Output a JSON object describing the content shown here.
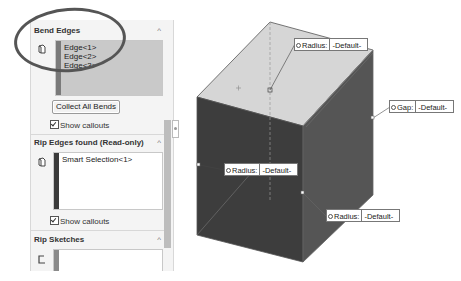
{
  "property_manager": {
    "bend_edges": {
      "title": "Bend Edges",
      "items": [
        "Edge<1>",
        "Edge<2>",
        "Edge<3>"
      ],
      "collect_button": "Collect All Bends",
      "show_callouts": "Show callouts",
      "show_callouts_checked": true,
      "bar_color": "#7a7a7a",
      "list_bg": "#c9c9c9"
    },
    "rip_edges": {
      "title": "Rip Edges found (Read-only)",
      "items": [
        "Smart Selection<1>"
      ],
      "show_callouts": "Show callouts",
      "show_callouts_checked": true,
      "bar_color": "#3a3a3a"
    },
    "rip_sketches": {
      "title": "Rip Sketches",
      "items": [],
      "bar_color": "#8a8a8a"
    }
  },
  "viewport": {
    "callouts": [
      {
        "label": "Radius:",
        "value": "-Default-"
      },
      {
        "label": "Gap:",
        "value": "-Default-"
      },
      {
        "label": "Radius:",
        "value": "-Default-"
      },
      {
        "label": "Radius:",
        "value": "-Default-"
      }
    ],
    "colors": {
      "top_face": "#d6d6d6",
      "front_face": "#3d3d3d",
      "side_face": "#555555"
    }
  }
}
